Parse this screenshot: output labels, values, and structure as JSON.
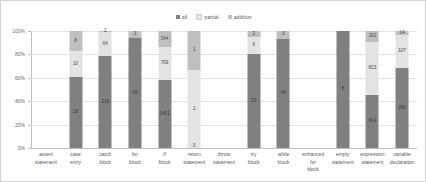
{
  "chart_data": {
    "type": "bar",
    "subtype": "100% stacked column",
    "title": "",
    "xlabel": "",
    "ylabel": "",
    "ylim": [
      0,
      100
    ],
    "ytick_labels": [
      "100%",
      "80%",
      "60%",
      "40%",
      "20%",
      "0%"
    ],
    "ytick_values": [
      100,
      80,
      60,
      40,
      20,
      0
    ],
    "grid": true,
    "legend_position": "top-center",
    "categories": [
      "assert statement",
      "case entry",
      "catch block",
      "for block",
      "if block",
      "return statement",
      "throw statement",
      "try block",
      "while block",
      "enhanced for block",
      "empty statement",
      "expression statement",
      "variable declaration"
    ],
    "series": [
      {
        "name": "all",
        "color": "#808080",
        "values": [
          0,
          28,
          239,
          45,
          1461,
          0,
          0,
          33,
          44,
          0,
          8,
          814,
          260
        ]
      },
      {
        "name": "partial",
        "color": "#e3e3e3",
        "values": [
          0,
          10,
          64,
          0,
          709,
          2,
          0,
          6,
          0,
          0,
          0,
          823,
          107
        ]
      },
      {
        "name": "addition",
        "color": "#bfbfbf",
        "values": [
          0,
          8,
          2,
          3,
          344,
          1,
          0,
          2,
          3,
          0,
          0,
          162,
          14
        ]
      }
    ],
    "bars": [
      {
        "category": "assert statement",
        "segments": []
      },
      {
        "category": "case entry",
        "segments": [
          {
            "series": "all",
            "value": "28",
            "pct": 60.9
          },
          {
            "series": "partial",
            "value": "10",
            "pct": 21.7
          },
          {
            "series": "addition",
            "value": "8",
            "pct": 17.4
          }
        ]
      },
      {
        "category": "catch block",
        "segments": [
          {
            "series": "all",
            "value": "239",
            "pct": 78.4
          },
          {
            "series": "partial",
            "value": "64",
            "pct": 21.0
          },
          {
            "series": "addition",
            "value": "2",
            "pct": 0.6
          }
        ]
      },
      {
        "category": "for block",
        "segments": [
          {
            "series": "all",
            "value": "45",
            "pct": 93.8
          },
          {
            "series": "partial",
            "value": "",
            "pct": 0
          },
          {
            "series": "addition",
            "value": "3",
            "pct": 6.2
          }
        ]
      },
      {
        "category": "if block",
        "segments": [
          {
            "series": "all",
            "value": "1461",
            "pct": 58.1
          },
          {
            "series": "partial",
            "value": "709",
            "pct": 28.2
          },
          {
            "series": "addition",
            "value": "344",
            "pct": 13.7
          }
        ]
      },
      {
        "category": "return statement",
        "segments": [
          {
            "series": "all",
            "value": "0",
            "pct": 0
          },
          {
            "series": "partial",
            "value": "2",
            "pct": 66.7
          },
          {
            "series": "addition",
            "value": "1",
            "pct": 33.3
          }
        ]
      },
      {
        "category": "throw statement",
        "segments": []
      },
      {
        "category": "try block",
        "segments": [
          {
            "series": "all",
            "value": "33",
            "pct": 80.5
          },
          {
            "series": "partial",
            "value": "6",
            "pct": 14.6
          },
          {
            "series": "addition",
            "value": "2",
            "pct": 4.9
          }
        ]
      },
      {
        "category": "while block",
        "segments": [
          {
            "series": "all",
            "value": "44",
            "pct": 93.6
          },
          {
            "series": "partial",
            "value": "",
            "pct": 0
          },
          {
            "series": "addition",
            "value": "3",
            "pct": 6.4
          }
        ]
      },
      {
        "category": "enhanced for block",
        "segments": []
      },
      {
        "category": "empty statement",
        "segments": [
          {
            "series": "all",
            "value": "8",
            "pct": 100
          },
          {
            "series": "partial",
            "value": "",
            "pct": 0
          },
          {
            "series": "addition",
            "value": "",
            "pct": 0
          }
        ]
      },
      {
        "category": "expression statement",
        "segments": [
          {
            "series": "all",
            "value": "814",
            "pct": 45.2
          },
          {
            "series": "partial",
            "value": "823",
            "pct": 45.8
          },
          {
            "series": "addition",
            "value": "162",
            "pct": 9.0
          }
        ]
      },
      {
        "category": "variable declaration",
        "segments": [
          {
            "series": "all",
            "value": "260",
            "pct": 68.2
          },
          {
            "series": "partial",
            "value": "107",
            "pct": 28.1
          },
          {
            "series": "addition",
            "value": "14",
            "pct": 3.7
          }
        ]
      }
    ]
  },
  "legend": {
    "items": [
      {
        "label": "all",
        "color": "#808080"
      },
      {
        "label": "partial",
        "color": "#e3e3e3"
      },
      {
        "label": "addition",
        "color": "#bfbfbf"
      }
    ]
  },
  "colors": {
    "all": "#808080",
    "partial": "#e3e3e3",
    "addition": "#bfbfbf",
    "axis": "#bfbfbf",
    "grid": "#e4e4e4",
    "text": "#595959",
    "frame": "#d2d2d2"
  }
}
